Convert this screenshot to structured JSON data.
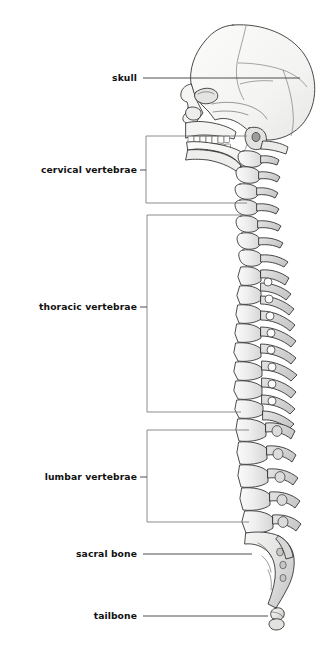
{
  "figure": {
    "background_color": "#ffffff",
    "label_color": "#111111",
    "leader_color": "#3a3a3a",
    "bracket_color": "#6e6e6e",
    "bone_fill_light": "#f7f7f5",
    "bone_fill_mid": "#e9e9e9",
    "bone_fill_shadow": "#cfcfcf",
    "bone_outline": "#2b2b2b"
  },
  "labels": [
    {
      "id": "skull",
      "text": "skull",
      "x": 137,
      "y": 78,
      "connector": "line"
    },
    {
      "id": "cervical",
      "text": "cervical vertebrae",
      "x": 137,
      "y": 170,
      "connector": "bracket"
    },
    {
      "id": "thoracic",
      "text": "thoracic vertebrae",
      "x": 137,
      "y": 307,
      "connector": "bracket"
    },
    {
      "id": "lumbar",
      "text": "lumbar vertebrae",
      "x": 137,
      "y": 477,
      "connector": "bracket"
    },
    {
      "id": "sacral",
      "text": "sacral bone",
      "x": 137,
      "y": 554,
      "connector": "line"
    },
    {
      "id": "tailbone",
      "text": "tailbone",
      "x": 137,
      "y": 616,
      "connector": "line"
    }
  ],
  "brackets": [
    {
      "id": "cervical-bracket",
      "x_left": 146,
      "x_right": 247,
      "y_top": 136,
      "y_bottom": 203,
      "tick_y": 170
    },
    {
      "id": "thoracic-bracket",
      "x_left": 147,
      "x_right": 241,
      "y_top": 215,
      "y_bottom": 412,
      "tick_y": 307
    },
    {
      "id": "lumbar-bracket",
      "x_left": 147,
      "x_right": 249,
      "y_top": 430,
      "y_bottom": 522,
      "tick_y": 477
    }
  ],
  "leaders": [
    {
      "id": "skull-leader",
      "x1": 143,
      "y1": 78,
      "x2": 300,
      "y2": 78
    },
    {
      "id": "sacral-leader",
      "x1": 143,
      "y1": 554,
      "x2": 252,
      "y2": 554
    },
    {
      "id": "tailbone-leader",
      "x1": 143,
      "y1": 616,
      "x2": 268,
      "y2": 616
    }
  ],
  "anatomy": {
    "regions": [
      {
        "name": "skull",
        "vertebra_count": 0
      },
      {
        "name": "cervical vertebrae",
        "vertebra_count": 7
      },
      {
        "name": "thoracic vertebrae",
        "vertebra_count": 12
      },
      {
        "name": "lumbar vertebrae",
        "vertebra_count": 5
      },
      {
        "name": "sacral bone",
        "vertebra_count": 5
      },
      {
        "name": "tailbone",
        "vertebra_count": 4
      }
    ]
  }
}
